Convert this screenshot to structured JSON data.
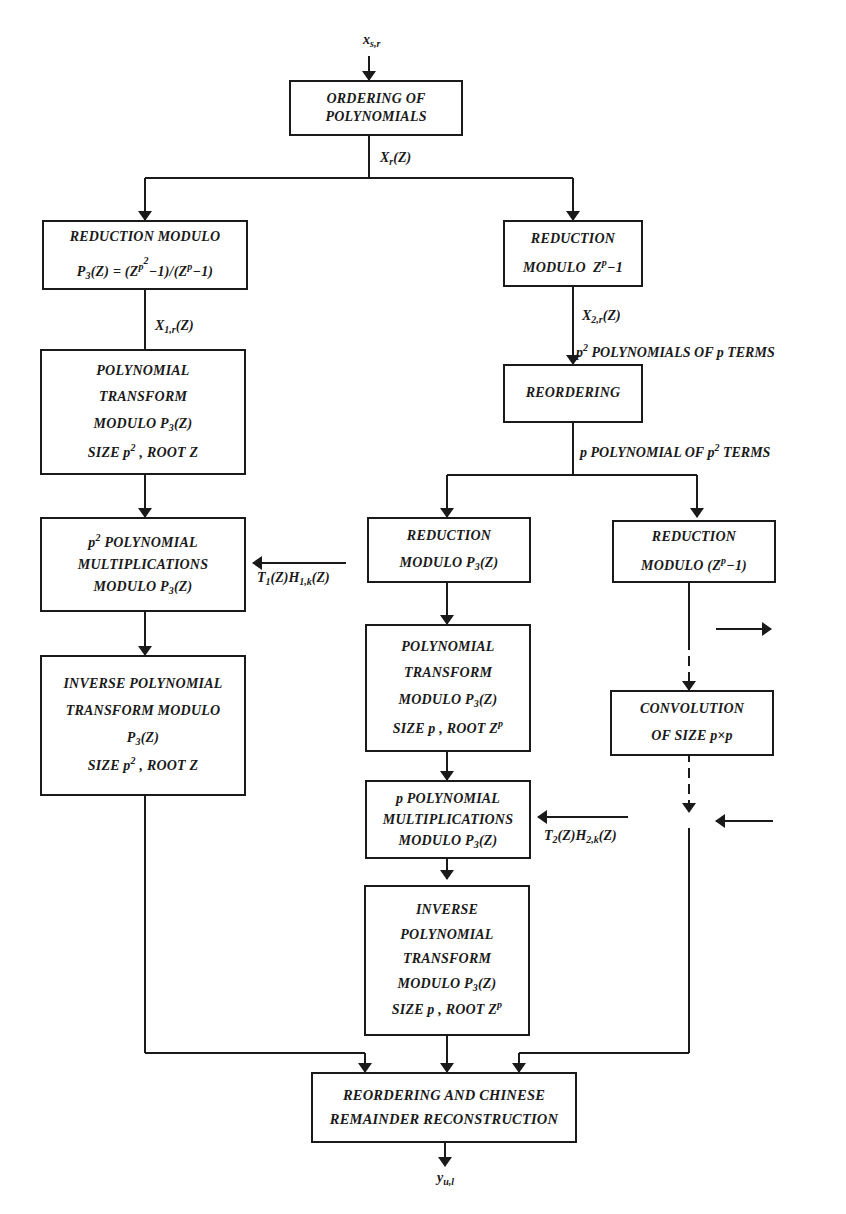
{
  "figure": {
    "input_label": "x_{s,r}",
    "output_label": "y_{u,l}",
    "edge_labels": {
      "after_ordering": "X_r(Z)",
      "after_reduction_p3": "X_{1,r}(Z)",
      "after_reduction_zp": "X_{2,r}(Z)",
      "p2_polys": "p^2 POLYNOMIALS OF p TERMS",
      "p_polys": "p POLYNOMIAL OF p^2 TERMS",
      "t1h1": "T_1(Z)H_{1,k}(Z)",
      "t2h2": "T_2(Z)H_{2,k}(Z)"
    },
    "boxes": {
      "ordering": [
        "ORDERING OF",
        "POLYNOMIALS"
      ],
      "reduction_p3": [
        "REDUCTION  MODULO",
        "P3(Z) = (Z^p^2 −1)/(Z^p −1)"
      ],
      "reduction_zp": [
        "REDUCTION",
        "MODULO  Z^p −1"
      ],
      "poly_transform_1": [
        "POLYNOMIAL",
        "TRANSFORM",
        "MODULO P3(Z)",
        "SIZE p^2 , ROOT Z"
      ],
      "reordering": [
        "REORDERING"
      ],
      "p2_mult": [
        "p^2 POLYNOMIAL",
        "MULTIPLICATIONS",
        "MODULO P3(Z)"
      ],
      "reduction_p3_b": [
        "REDUCTION",
        "MODULO P3(Z)"
      ],
      "reduction_zp_b": [
        "REDUCTION",
        "MODULO (Z^p −1)"
      ],
      "inverse_transform_1": [
        "INVERSE POLYNOMIAL",
        "TRANSFORM MODULO",
        "P3(Z)",
        "SIZE p^2 , ROOT Z"
      ],
      "poly_transform_2": [
        "POLYNOMIAL",
        "TRANSFORM",
        "MODULO P3(Z)",
        "SIZE p , ROOT Z^p"
      ],
      "convolution": [
        "CONVOLUTION",
        "OF SIZE p×p"
      ],
      "p_mult": [
        "p POLYNOMIAL",
        "MULTIPLICATIONS",
        "MODULO P3(Z)"
      ],
      "inverse_transform_2": [
        "INVERSE",
        "POLYNOMIAL",
        "TRANSFORM",
        "MODULO P3(Z)",
        "SIZE p , ROOT Z^p"
      ],
      "crt": [
        "REORDERING AND CHINESE",
        "REMAINDER RECONSTRUCTION"
      ]
    }
  }
}
